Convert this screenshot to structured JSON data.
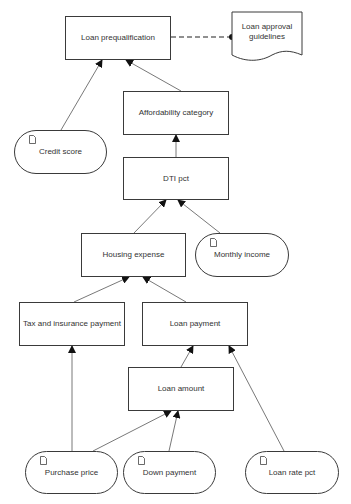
{
  "diagram": {
    "nodes": {
      "loan_prequalification": "Loan prequalification",
      "loan_approval_guidelines": "Loan approval guidelines",
      "affordability_category": "Affordability category",
      "credit_score": "Credit score",
      "dti_pct": "DTI pct",
      "housing_expense": "Housing expense",
      "monthly_income": "Monthly income",
      "tax_insurance_payment": "Tax and insurance payment",
      "loan_payment": "Loan payment",
      "loan_amount": "Loan amount",
      "purchase_price": "Purchase price",
      "down_payment": "Down payment",
      "loan_rate_pct": "Loan rate pct"
    },
    "edges": [
      {
        "from": "Credit score",
        "to": "Loan prequalification",
        "style": "solid-arrow"
      },
      {
        "from": "Affordability category",
        "to": "Loan prequalification",
        "style": "solid-arrow"
      },
      {
        "from": "Loan approval guidelines",
        "to": "Loan prequalification",
        "style": "dashed-dot"
      },
      {
        "from": "DTI pct",
        "to": "Affordability category",
        "style": "solid-arrow"
      },
      {
        "from": "Housing expense",
        "to": "DTI pct",
        "style": "solid-arrow"
      },
      {
        "from": "Monthly income",
        "to": "DTI pct",
        "style": "solid-arrow"
      },
      {
        "from": "Tax and insurance payment",
        "to": "Housing expense",
        "style": "solid-arrow"
      },
      {
        "from": "Loan payment",
        "to": "Housing expense",
        "style": "solid-arrow"
      },
      {
        "from": "Purchase price",
        "to": "Tax and insurance payment",
        "style": "solid-arrow"
      },
      {
        "from": "Loan amount",
        "to": "Loan payment",
        "style": "solid-arrow"
      },
      {
        "from": "Loan rate pct",
        "to": "Loan payment",
        "style": "solid-arrow"
      },
      {
        "from": "Purchase price",
        "to": "Loan amount",
        "style": "solid-arrow"
      },
      {
        "from": "Down payment",
        "to": "Loan amount",
        "style": "solid-arrow"
      }
    ],
    "colors": {
      "stroke": "#3a3a3a",
      "fill": "#ffffff",
      "text": "#333333"
    }
  }
}
